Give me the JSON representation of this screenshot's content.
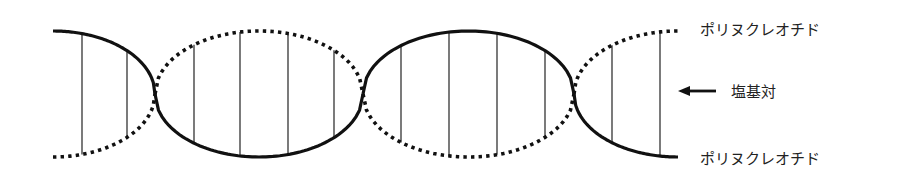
{
  "labels": {
    "top_strand": "ポリヌクレオチド",
    "base_pair": "塩基対",
    "bottom_strand": "ポリヌクレオチド"
  },
  "strands": [
    {
      "name": "strand-1",
      "style": "solid"
    },
    {
      "name": "strand-2",
      "style": "dotted"
    }
  ],
  "helix": {
    "crossings": 3,
    "segments": [
      {
        "top": "solid",
        "bottom": "dotted",
        "base_pairs": 2
      },
      {
        "top": "dotted",
        "bottom": "solid",
        "base_pairs": 4
      },
      {
        "top": "solid",
        "bottom": "dotted",
        "base_pairs": 4
      },
      {
        "top": "dotted",
        "bottom": "solid",
        "base_pairs": 2
      }
    ]
  },
  "icons": {
    "base_pair_pointer": "arrow-left-icon"
  },
  "colors": {
    "line": "#111111",
    "text": "#222222",
    "background": "#ffffff"
  }
}
